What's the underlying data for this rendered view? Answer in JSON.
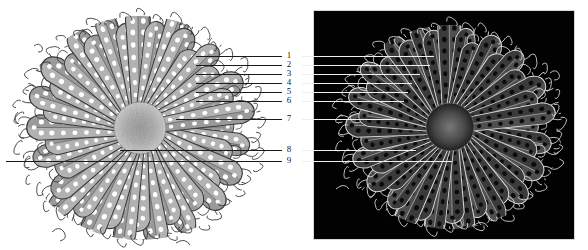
{
  "figure": {
    "background_color": "#ffffff",
    "panels": [
      {
        "id": "positive",
        "name": "grayscale-positive-panel",
        "render": "positive",
        "background_color": "#ffffff",
        "ink_color": "#555555",
        "x": 0,
        "y": 0,
        "width": 300,
        "height": 250
      },
      {
        "id": "negative",
        "name": "inverted-negative-panel",
        "render": "negative",
        "background_color": "#020202",
        "ink_color": "#e8e8e8",
        "x": 314,
        "y": 11,
        "width": 260,
        "height": 228
      }
    ]
  },
  "callouts": {
    "label_color": "#1a1a1a",
    "leader_color_left": "#1b1b1b",
    "leader_color_right": "#efefef",
    "items": [
      {
        "number": "1",
        "y": 56,
        "left_line_start": 196,
        "left_line_end": 282,
        "right_line_start": 302,
        "right_line_end": 434
      },
      {
        "number": "2",
        "y": 65,
        "left_line_start": 196,
        "left_line_end": 282,
        "right_line_start": 302,
        "right_line_end": 430
      },
      {
        "number": "3",
        "y": 74,
        "left_line_start": 196,
        "left_line_end": 282,
        "right_line_start": 302,
        "right_line_end": 420
      },
      {
        "number": "4",
        "y": 83,
        "left_line_start": 196,
        "left_line_end": 282,
        "right_line_start": 302,
        "right_line_end": 412
      },
      {
        "number": "5",
        "y": 92,
        "left_line_start": 196,
        "left_line_end": 282,
        "right_line_start": 302,
        "right_line_end": 408
      },
      {
        "number": "6",
        "y": 101,
        "left_line_start": 196,
        "left_line_end": 282,
        "right_line_start": 302,
        "right_line_end": 404
      },
      {
        "number": "7",
        "y": 119,
        "left_line_start": 176,
        "left_line_end": 282,
        "right_line_start": 302,
        "right_line_end": 396
      },
      {
        "number": "8",
        "y": 150,
        "left_line_start": 120,
        "left_line_end": 282,
        "right_line_start": 302,
        "right_line_end": 416
      },
      {
        "number": "9",
        "y": 161,
        "left_line_start": 6,
        "left_line_end": 282,
        "right_line_start": 302,
        "right_line_end": 452
      }
    ]
  }
}
